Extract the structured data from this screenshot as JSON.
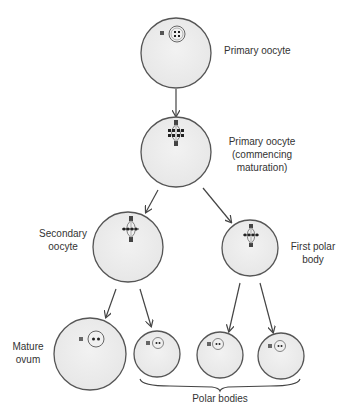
{
  "diagram": {
    "colors": {
      "cell_fill": "#ececec",
      "cell_stroke": "#555555",
      "arrow": "#444444",
      "chromosome": "#222222",
      "text": "#333333"
    },
    "labels": {
      "primary_oocyte": "Primary oocyte",
      "primary_maturing_line1": "Primary oocyte",
      "primary_maturing_line2": "(commencing",
      "primary_maturing_line3": "maturation)",
      "secondary_line1": "Secondary",
      "secondary_line2": "oocyte",
      "first_polar_line1": "First polar",
      "first_polar_line2": "body",
      "mature_line1": "Mature",
      "mature_line2": "ovum",
      "polar_bodies": "Polar bodies"
    },
    "cells": [
      {
        "id": "primary-oocyte",
        "cx": 176,
        "cy": 53,
        "r": 35,
        "content": "nucleus-4-chromosomes"
      },
      {
        "id": "primary-oocyte-maturing",
        "cx": 176,
        "cy": 152,
        "r": 35,
        "content": "spindle"
      },
      {
        "id": "secondary-oocyte",
        "cx": 128,
        "cy": 247,
        "r": 35,
        "content": "spindle"
      },
      {
        "id": "first-polar-body",
        "cx": 250,
        "cy": 248,
        "r": 28,
        "content": "spindle"
      },
      {
        "id": "mature-ovum",
        "cx": 90,
        "cy": 354,
        "r": 36,
        "content": "nucleus-2-chromosomes"
      },
      {
        "id": "polar-body-1",
        "cx": 157,
        "cy": 354,
        "r": 23,
        "content": "nucleus-2-chromosomes"
      },
      {
        "id": "polar-body-2",
        "cx": 220,
        "cy": 355,
        "r": 23,
        "content": "nucleus-2-chromosomes"
      },
      {
        "id": "polar-body-3",
        "cx": 281,
        "cy": 356,
        "r": 23,
        "content": "nucleus-2-chromosomes"
      }
    ],
    "arrows": [
      {
        "from": "primary-oocyte",
        "to": "primary-oocyte-maturing"
      },
      {
        "from": "primary-oocyte-maturing",
        "to": "secondary-oocyte"
      },
      {
        "from": "primary-oocyte-maturing",
        "to": "first-polar-body"
      },
      {
        "from": "secondary-oocyte",
        "to": "mature-ovum"
      },
      {
        "from": "secondary-oocyte",
        "to": "polar-body-1"
      },
      {
        "from": "first-polar-body",
        "to": "polar-body-2"
      },
      {
        "from": "first-polar-body",
        "to": "polar-body-3"
      }
    ]
  }
}
